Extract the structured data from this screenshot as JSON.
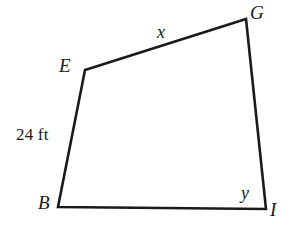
{
  "figure": {
    "kind": "quadrilateral-diagram",
    "background_color": "#ffffff",
    "stroke_color": "#1a1a1a",
    "stroke_width": 2.6,
    "canvas": {
      "width": 292,
      "height": 227
    },
    "vertices": [
      {
        "name": "B",
        "label": "B",
        "x": 58,
        "y": 207
      },
      {
        "name": "E",
        "label": "E",
        "x": 85,
        "y": 70
      },
      {
        "name": "G",
        "label": "G",
        "x": 246,
        "y": 19
      },
      {
        "name": "I",
        "label": "I",
        "x": 266,
        "y": 209
      }
    ],
    "outline_points": "58,207 85,70 246,19 266,209",
    "vertex_labels": {
      "G": "G",
      "E": "E",
      "B": "B",
      "I": "I"
    },
    "side_labels": {
      "top_EG": "x",
      "left_BE": "24 ft"
    },
    "angle_labels": {
      "at_I": "y"
    },
    "sides": [
      {
        "from": "B",
        "to": "E",
        "label": "24 ft",
        "label_type": "measure"
      },
      {
        "from": "E",
        "to": "G",
        "label": "x",
        "label_type": "variable"
      },
      {
        "from": "G",
        "to": "I",
        "label": "",
        "label_type": "none"
      },
      {
        "from": "I",
        "to": "B",
        "label": "",
        "label_type": "none"
      }
    ],
    "angles": [
      {
        "at": "I",
        "label": "y",
        "label_type": "variable"
      }
    ]
  }
}
